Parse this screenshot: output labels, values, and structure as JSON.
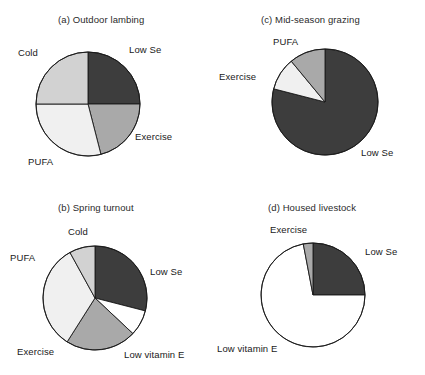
{
  "figure": {
    "background": "#ffffff",
    "width": 425,
    "height": 375
  },
  "palette": {
    "low_se": "#3d3d3d",
    "exercise": "#a9a9a9",
    "cold": "#d2d2d2",
    "pufa": "#f0f0f0",
    "low_vitamin_e": "#ffffff",
    "outline": "#1a1a1a",
    "text": "#1a1a1a"
  },
  "chart_data": [
    {
      "type": "pie",
      "id": "a",
      "title": "(a) Outdoor lambing",
      "categories": [
        "Low Se",
        "Exercise",
        "PUFA",
        "Cold"
      ],
      "values": [
        25,
        21,
        29,
        25
      ],
      "unit": "percent",
      "colors": [
        "#3d3d3d",
        "#a9a9a9",
        "#f0f0f0",
        "#d2d2d2"
      ],
      "start_angle_deg": 0,
      "labels": [
        {
          "text": "Low Se",
          "position": "right-top"
        },
        {
          "text": "Exercise",
          "position": "right-bottom"
        },
        {
          "text": "PUFA",
          "position": "bottom-left"
        },
        {
          "text": "Cold",
          "position": "left-top"
        }
      ]
    },
    {
      "type": "pie",
      "id": "c",
      "title": "(c) Mid-season grazing",
      "categories": [
        "Low Se",
        "PUFA",
        "Exercise"
      ],
      "values": [
        79,
        10,
        11
      ],
      "unit": "percent",
      "colors": [
        "#3d3d3d",
        "#f0f0f0",
        "#a9a9a9"
      ],
      "start_angle_deg": 0,
      "labels": [
        {
          "text": "Low Se",
          "position": "right-bottom"
        },
        {
          "text": "PUFA",
          "position": "top-left"
        },
        {
          "text": "Exercise",
          "position": "left"
        }
      ]
    },
    {
      "type": "pie",
      "id": "b",
      "title": "(b) Spring turnout",
      "categories": [
        "Low Se",
        "Low vitamin E",
        "Exercise",
        "PUFA",
        "Cold"
      ],
      "values": [
        29,
        8,
        22,
        33,
        8
      ],
      "unit": "percent",
      "colors": [
        "#3d3d3d",
        "#ffffff",
        "#a9a9a9",
        "#f0f0f0",
        "#d2d2d2"
      ],
      "start_angle_deg": 0,
      "labels": [
        {
          "text": "Low Se",
          "position": "right"
        },
        {
          "text": "Low vitamin E",
          "position": "bottom-right"
        },
        {
          "text": "Exercise",
          "position": "bottom-left"
        },
        {
          "text": "PUFA",
          "position": "left-top"
        },
        {
          "text": "Cold",
          "position": "top"
        }
      ]
    },
    {
      "type": "pie",
      "id": "d",
      "title": "(d) Housed livestock",
      "categories": [
        "Low Se",
        "Low vitamin E",
        "Exercise"
      ],
      "values": [
        25,
        72,
        3
      ],
      "unit": "percent",
      "colors": [
        "#3d3d3d",
        "#ffffff",
        "#a9a9a9"
      ],
      "start_angle_deg": 0,
      "labels": [
        {
          "text": "Low Se",
          "position": "right-top"
        },
        {
          "text": "Low vitamin E",
          "position": "bottom-left"
        },
        {
          "text": "Exercise",
          "position": "top"
        }
      ]
    }
  ],
  "panels": {
    "a": {
      "title": "(a) Outdoor lambing",
      "labels": {
        "low_se": "Low Se",
        "exercise": "Exercise",
        "pufa": "PUFA",
        "cold": "Cold"
      }
    },
    "b": {
      "title": "(b) Spring turnout",
      "labels": {
        "low_se": "Low Se",
        "low_vitamin_e": "Low vitamin E",
        "exercise": "Exercise",
        "pufa": "PUFA",
        "cold": "Cold"
      }
    },
    "c": {
      "title": "(c) Mid-season grazing",
      "labels": {
        "low_se": "Low Se",
        "pufa": "PUFA",
        "exercise": "Exercise"
      }
    },
    "d": {
      "title": "(d) Housed livestock",
      "labels": {
        "low_se": "Low Se",
        "low_vitamin_e": "Low vitamin E",
        "exercise": "Exercise"
      }
    }
  }
}
